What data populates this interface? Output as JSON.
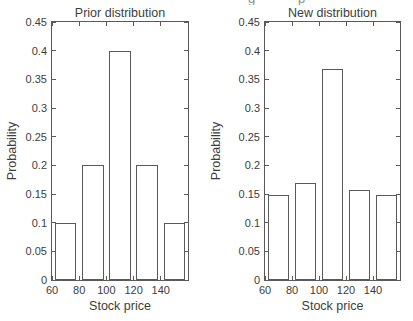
{
  "figure": {
    "cropped_caption_fragment": {
      "left_glyph": "g",
      "right_glyph": "p"
    }
  },
  "colors": {
    "line": "#5a5a5a",
    "text": "#3d3d3d",
    "background": "#ffffff",
    "bar_fill": "#ffffff"
  },
  "chart_data": [
    {
      "type": "bar",
      "title": "Prior distribution",
      "xlabel": "Stock price",
      "ylabel": "Probability",
      "bar_centers": [
        70,
        90,
        110,
        130,
        150
      ],
      "bar_width": 16,
      "values": [
        0.1,
        0.2,
        0.4,
        0.2,
        0.1
      ],
      "xlim": [
        60,
        160
      ],
      "ylim": [
        0,
        0.45
      ],
      "xticks": [
        60,
        80,
        100,
        120,
        140
      ],
      "yticks": [
        0,
        0.05,
        0.1,
        0.15,
        0.2,
        0.25,
        0.3,
        0.35,
        0.4,
        0.45
      ],
      "xtick_labels": [
        "60",
        "80",
        "100",
        "120",
        "140"
      ],
      "ytick_labels": [
        "0",
        "0.05",
        "0.1",
        "0.15",
        "0.2",
        "0.25",
        "0.3",
        "0.35",
        "0.4",
        "0.45"
      ],
      "grid": false,
      "legend": null
    },
    {
      "type": "bar",
      "title": "New distribution",
      "xlabel": "Stock price",
      "ylabel": "Probability",
      "bar_centers": [
        70,
        90,
        110,
        130,
        150
      ],
      "bar_width": 16,
      "values": [
        0.149,
        0.17,
        0.368,
        0.157,
        0.149
      ],
      "xlim": [
        60,
        160
      ],
      "ylim": [
        0,
        0.45
      ],
      "xticks": [
        60,
        80,
        100,
        120,
        140
      ],
      "yticks": [
        0,
        0.05,
        0.1,
        0.15,
        0.2,
        0.25,
        0.3,
        0.35,
        0.4,
        0.45
      ],
      "xtick_labels": [
        "60",
        "80",
        "100",
        "120",
        "140"
      ],
      "ytick_labels": [
        "0",
        "0.05",
        "0.1",
        "0.15",
        "0.2",
        "0.25",
        "0.3",
        "0.35",
        "0.4",
        "0.45"
      ],
      "grid": false,
      "legend": null
    }
  ]
}
